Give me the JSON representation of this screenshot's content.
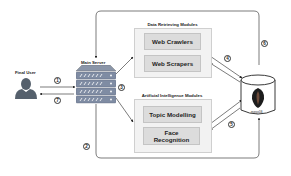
{
  "diagram": {
    "actors": {
      "user": {
        "label": "Final User",
        "icon": "person-icon"
      },
      "server": {
        "label": "Main Server",
        "icon": "server-stack-icon"
      },
      "database": {
        "label": "mongoDB",
        "icon": "database-icon"
      }
    },
    "groups": [
      {
        "title": "Data Retrieving Modules",
        "modules": [
          "Web Crawlers",
          "Web Scrapers"
        ]
      },
      {
        "title": "Artificial Intelligence Modules",
        "modules": [
          "Topic Modelling",
          "Face Recognition"
        ]
      }
    ],
    "steps": [
      "1",
      "2",
      "3",
      "4",
      "5",
      "6",
      "7"
    ],
    "edges": [
      {
        "step": "1",
        "from": "Final User",
        "to": "Main Server"
      },
      {
        "step": "7",
        "from": "Main Server",
        "to": "Final User"
      },
      {
        "step": "3",
        "from": "Main Server",
        "to": "Data Retrieving Modules / Artificial Intelligence Modules"
      },
      {
        "step": "4",
        "from": "Data Retrieving Modules",
        "to": "mongoDB",
        "bidirectional": true
      },
      {
        "step": "5",
        "from": "Artificial Intelligence Modules",
        "to": "mongoDB",
        "bidirectional": true
      },
      {
        "step": "2",
        "from": "Main Server",
        "to": "mongoDB"
      },
      {
        "step": "6",
        "from": "mongoDB",
        "to": "Main Server"
      }
    ],
    "colors": {
      "line": "#333333",
      "group_fill": "#f2f2f2",
      "module_fill": "#dcdcdc",
      "server": "#7f8ca3",
      "user": "#55606c"
    }
  }
}
